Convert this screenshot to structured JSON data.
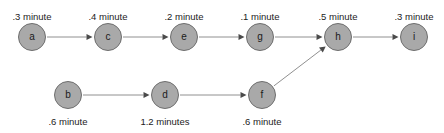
{
  "diagram": {
    "type": "activity-network",
    "title": "",
    "width": 444,
    "height": 133,
    "node_fill_color": "#a9a9a9",
    "node_stroke_color": "#6e6e6e",
    "edge_color": "#909090",
    "arrowhead_color": "#4a4a4a",
    "text_color": "#1c1c1c",
    "background_color": "#ffffff",
    "nodes": [
      {
        "id": "a",
        "label": "a",
        "duration": ".3 minute",
        "duration_position": "above",
        "cx": 32,
        "cy": 37,
        "r": 14
      },
      {
        "id": "c",
        "label": "c",
        "duration": ".4 minute",
        "duration_position": "above",
        "cx": 108,
        "cy": 37,
        "r": 14
      },
      {
        "id": "e",
        "label": "e",
        "duration": ".2 minute",
        "duration_position": "above",
        "cx": 184,
        "cy": 37,
        "r": 14
      },
      {
        "id": "g",
        "label": "g",
        "duration": ".1 minute",
        "duration_position": "above",
        "cx": 260,
        "cy": 37,
        "r": 14
      },
      {
        "id": "h",
        "label": "h",
        "duration": ".5 minute",
        "duration_position": "above",
        "cx": 338,
        "cy": 37,
        "r": 14
      },
      {
        "id": "i",
        "label": "i",
        "duration": ".3 minute",
        "duration_position": "above",
        "cx": 414,
        "cy": 37,
        "r": 14
      },
      {
        "id": "b",
        "label": "b",
        "duration": ".6 minute",
        "duration_position": "below",
        "cx": 68,
        "cy": 95,
        "r": 14
      },
      {
        "id": "d",
        "label": "d",
        "duration": "1.2 minutes",
        "duration_position": "below",
        "cx": 165,
        "cy": 95,
        "r": 14
      },
      {
        "id": "f",
        "label": "f",
        "duration": ".6 minute",
        "duration_position": "below",
        "cx": 262,
        "cy": 95,
        "r": 14
      }
    ],
    "edges": [
      {
        "from": "a",
        "to": "c"
      },
      {
        "from": "c",
        "to": "e"
      },
      {
        "from": "e",
        "to": "g"
      },
      {
        "from": "g",
        "to": "h"
      },
      {
        "from": "h",
        "to": "i"
      },
      {
        "from": "b",
        "to": "d"
      },
      {
        "from": "d",
        "to": "f"
      },
      {
        "from": "f",
        "to": "h"
      }
    ],
    "duration_label_offset_above": 12,
    "duration_label_offset_below": 21
  }
}
